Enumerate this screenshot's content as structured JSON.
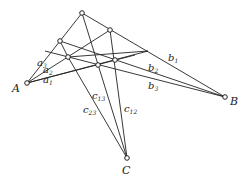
{
  "labels": {
    "A": "A",
    "B": "B",
    "C": "C",
    "a1": "a",
    "a1s": "1",
    "a2": "a",
    "a2s": "2",
    "a3": "a",
    "a3s": "3",
    "b1": "b",
    "b1s": "1",
    "b2": "b",
    "b2s": "2",
    "b3": "b",
    "b3s": "3",
    "c12": "c",
    "c12s": "12",
    "c13": "c",
    "c13s": "13",
    "c23": "c",
    "c23s": "23"
  },
  "colors": {
    "line": "#222222",
    "point_fill": "#ffffff"
  }
}
